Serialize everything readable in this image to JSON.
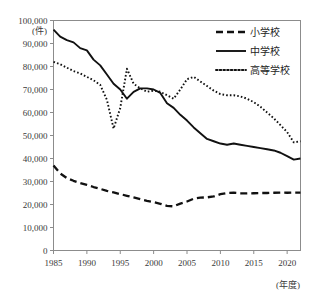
{
  "chart_data": {
    "type": "line",
    "title": "",
    "xlabel": "(年度)",
    "ylabel": "(件)",
    "xlim": [
      1985,
      2022
    ],
    "ylim": [
      0,
      100000
    ],
    "grid": false,
    "legend_position": "top-right",
    "x_tick_labels": [
      "1985",
      "1990",
      "1995",
      "2000",
      "2005",
      "2010",
      "2015",
      "2020"
    ],
    "x_ticks": [
      1985,
      1990,
      1995,
      2000,
      2005,
      2010,
      2015,
      2020
    ],
    "y_tick_labels": [
      "0",
      "10,000",
      "20,000",
      "30,000",
      "40,000",
      "50,000",
      "60,000",
      "70,000",
      "80,000",
      "90,000",
      "100,000"
    ],
    "y_ticks": [
      0,
      10000,
      20000,
      30000,
      40000,
      50000,
      60000,
      70000,
      80000,
      90000,
      100000
    ],
    "x": [
      1985,
      1986,
      1987,
      1988,
      1989,
      1990,
      1991,
      1992,
      1993,
      1994,
      1995,
      1996,
      1997,
      1998,
      1999,
      2000,
      2001,
      2002,
      2003,
      2004,
      2005,
      2006,
      2007,
      2008,
      2009,
      2010,
      2011,
      2012,
      2013,
      2014,
      2015,
      2016,
      2017,
      2018,
      2019,
      2020,
      2021,
      2022
    ],
    "series": [
      {
        "name": "小学校",
        "style": "dashed",
        "values": [
          37000,
          33500,
          31500,
          30300,
          29300,
          28500,
          27600,
          26800,
          25900,
          25300,
          24500,
          23800,
          23100,
          22300,
          21600,
          21000,
          20300,
          19400,
          19200,
          20400,
          21300,
          22500,
          23000,
          23100,
          23500,
          24500,
          25000,
          25100,
          24900,
          24800,
          24900,
          25000,
          25000,
          25100,
          25200,
          25100,
          25200,
          25200
        ]
      },
      {
        "name": "中学校",
        "style": "solid",
        "values": [
          96000,
          93000,
          91500,
          90500,
          88000,
          87000,
          83000,
          80500,
          76500,
          72500,
          70000,
          66000,
          69000,
          70500,
          70500,
          70000,
          68500,
          64000,
          62000,
          59000,
          56500,
          53500,
          51000,
          48500,
          47500,
          46500,
          46000,
          46500,
          46000,
          45500,
          45000,
          44500,
          44000,
          43500,
          42500,
          41000,
          39500,
          40000
        ]
      },
      {
        "name": "高等学校",
        "style": "dotted",
        "values": [
          82000,
          81000,
          79500,
          78000,
          77000,
          75500,
          74000,
          72000,
          65500,
          53000,
          62000,
          79000,
          72500,
          70500,
          69000,
          69500,
          69000,
          67500,
          66000,
          70000,
          74500,
          75500,
          73500,
          71500,
          69500,
          68000,
          67500,
          67500,
          67000,
          66000,
          64500,
          62500,
          60000,
          57500,
          54500,
          51500,
          47000,
          47500
        ]
      }
    ]
  },
  "legend": {
    "items": [
      {
        "label": "小学校",
        "style": "dashed"
      },
      {
        "label": "中学校",
        "style": "solid"
      },
      {
        "label": "高等学校",
        "style": "dotted"
      }
    ]
  },
  "axes": {
    "y_unit": "(件)",
    "x_unit": "(年度)"
  },
  "colors": {
    "line": "#111111",
    "frame": "#8c8c8c",
    "text": "#2b2b2b",
    "background": "#ffffff"
  }
}
